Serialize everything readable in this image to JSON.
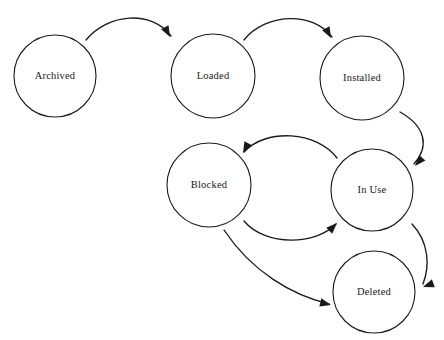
{
  "diagram": {
    "background_color": "#ffffff",
    "stroke_color": "#1a1a1a",
    "width": 444,
    "height": 340,
    "nodes": [
      {
        "id": "archived",
        "label": "Archived",
        "cx": 55,
        "cy": 76,
        "r": 41
      },
      {
        "id": "loaded",
        "label": "Loaded",
        "cx": 213,
        "cy": 76,
        "r": 42
      },
      {
        "id": "installed",
        "label": "Installed",
        "cx": 362,
        "cy": 78,
        "r": 42
      },
      {
        "id": "blocked",
        "label": "Blocked",
        "cx": 209,
        "cy": 185,
        "r": 42
      },
      {
        "id": "inuse",
        "label": "In Use",
        "cx": 372,
        "cy": 190,
        "r": 41
      },
      {
        "id": "deleted",
        "label": "Deleted",
        "cx": 374,
        "cy": 292,
        "r": 41
      }
    ],
    "edges": [
      {
        "id": "archived-to-loaded",
        "from": "Archived",
        "to": "Loaded",
        "path": "M 86,40 C 108,13 152,10 171,36",
        "head": "M 171,36 L 161,29 L 173,25 Z",
        "head_rotate": 62,
        "head_x": 170,
        "head_y": 37
      },
      {
        "id": "loaded-to-installed",
        "from": "Loaded",
        "to": "Installed",
        "path": "M 244,40 C 266,13 312,11 332,37",
        "head": "M 332,37 L 322,30 L 334,26 Z",
        "head_rotate": 62,
        "head_x": 331,
        "head_y": 38
      },
      {
        "id": "installed-to-inuse",
        "from": "Installed",
        "to": "In Use",
        "path": "M 400,112 C 425,126 430,146 414,164",
        "head": "M 414,164 L 411,152 L 422,157 Z",
        "head_rotate": 131,
        "head_x": 415,
        "head_y": 166
      },
      {
        "id": "inuse-to-blocked",
        "from": "In Use",
        "to": "Blocked",
        "path": "M 337,158 C 317,131 266,128 244,152",
        "head": "M 244,152 L 256,147 L 254,159 Z",
        "head_rotate": 118,
        "head_x": 243,
        "head_y": 153
      },
      {
        "id": "blocked-to-inuse",
        "from": "Blocked",
        "to": "In Use",
        "path": "M 244,221 C 266,247 316,245 336,224",
        "head": "M 336,224 L 325,229 L 326,217 Z",
        "head_rotate": 315,
        "head_x": 337,
        "head_y": 223
      },
      {
        "id": "blocked-to-deleted",
        "from": "Blocked",
        "to": "Deleted",
        "path": "M 224,230 C 252,272 292,295 329,304",
        "head": "M 329,304 L 318,300 L 320,291 Z",
        "head_rotate": 14,
        "head_x": 331,
        "head_y": 305
      },
      {
        "id": "inuse-to-deleted",
        "from": "In Use",
        "to": "Deleted",
        "path": "M 412,224 C 429,242 430,266 423,284",
        "head": "M 423,284 L 417,273 L 429,273 Z",
        "head_rotate": 160,
        "head_x": 423,
        "head_y": 287
      }
    ]
  }
}
